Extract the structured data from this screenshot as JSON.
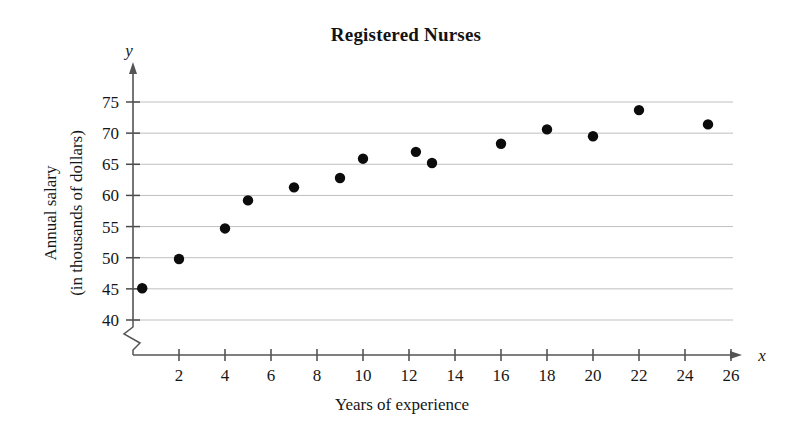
{
  "chart_data": {
    "type": "scatter",
    "title": "Registered Nurses",
    "xlabel": "Years of experience",
    "ylabel": "Annual salary\n(in thousands of dollars)",
    "ylabel_line1": "Annual salary",
    "ylabel_line2": "(in thousands of dollars)",
    "x_axis_variable": "x",
    "y_axis_variable": "y",
    "xlim": [
      0,
      27
    ],
    "ylim": [
      40,
      77
    ],
    "y_axis_break": true,
    "grid": "horizontal",
    "legend": "none",
    "xticks": [
      2,
      4,
      6,
      8,
      10,
      12,
      14,
      16,
      18,
      20,
      22,
      24,
      26
    ],
    "yticks": [
      40,
      45,
      50,
      55,
      60,
      65,
      70,
      75
    ],
    "xtick_labels": [
      "2",
      "4",
      "6",
      "8",
      "10",
      "12",
      "14",
      "16",
      "18",
      "20",
      "22",
      "24",
      "26"
    ],
    "ytick_labels": [
      "40",
      "45",
      "50",
      "55",
      "60",
      "65",
      "70",
      "75"
    ],
    "points": [
      {
        "x": 0.4,
        "y": 45.1
      },
      {
        "x": 2.0,
        "y": 49.8
      },
      {
        "x": 4.0,
        "y": 54.7
      },
      {
        "x": 5.0,
        "y": 59.2
      },
      {
        "x": 7.0,
        "y": 61.3
      },
      {
        "x": 9.0,
        "y": 62.8
      },
      {
        "x": 10.0,
        "y": 65.9
      },
      {
        "x": 12.3,
        "y": 67.0
      },
      {
        "x": 13.0,
        "y": 65.2
      },
      {
        "x": 16.0,
        "y": 68.3
      },
      {
        "x": 18.0,
        "y": 70.6
      },
      {
        "x": 20.0,
        "y": 69.5
      },
      {
        "x": 22.0,
        "y": 73.7
      },
      {
        "x": 25.0,
        "y": 71.4
      }
    ]
  }
}
